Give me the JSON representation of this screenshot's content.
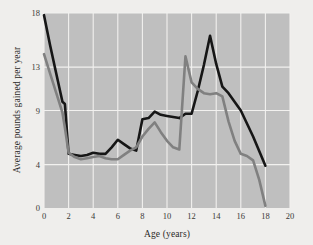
{
  "chart_data": {
    "type": "line",
    "title": "",
    "xlabel": "Age (years)",
    "ylabel": "Average pounds gained per year",
    "xlim": [
      0,
      20
    ],
    "ylim": [
      0,
      18
    ],
    "grid": true,
    "legend": "none",
    "plot_background": "#bfbfbf",
    "page_background": "#efeeec",
    "xticks": [
      {
        "value": 0,
        "label": "0"
      },
      {
        "value": 2,
        "label": "2"
      },
      {
        "value": 4,
        "label": "4"
      },
      {
        "value": 6,
        "label": "6"
      },
      {
        "value": 8,
        "label": "8"
      },
      {
        "value": 10,
        "label": "10"
      },
      {
        "value": 12,
        "label": "12"
      },
      {
        "value": 14,
        "label": "14"
      },
      {
        "value": 16,
        "label": "16"
      },
      {
        "value": 18,
        "label": "18"
      },
      {
        "value": 20,
        "label": "20"
      }
    ],
    "yticks": [
      {
        "value": 0,
        "label": "0"
      },
      {
        "value": 4,
        "label": "4"
      },
      {
        "value": 9,
        "label": "9"
      },
      {
        "value": 13,
        "label": "13"
      },
      {
        "value": 18,
        "label": "18"
      }
    ],
    "series": [
      {
        "name": "dark-series",
        "color": "#161616",
        "width": 2.6,
        "points": [
          [
            0.0,
            17.8
          ],
          [
            0.5,
            15.0
          ],
          [
            1.0,
            12.4
          ],
          [
            1.5,
            9.8
          ],
          [
            1.7,
            9.6
          ],
          [
            2.0,
            5.0
          ],
          [
            2.5,
            4.9
          ],
          [
            3.0,
            4.8
          ],
          [
            3.5,
            4.9
          ],
          [
            4.0,
            5.1
          ],
          [
            4.5,
            5.0
          ],
          [
            5.0,
            5.0
          ],
          [
            5.5,
            5.6
          ],
          [
            6.0,
            6.3
          ],
          [
            6.5,
            5.9
          ],
          [
            7.0,
            5.5
          ],
          [
            7.5,
            5.3
          ],
          [
            8.0,
            8.2
          ],
          [
            8.5,
            8.3
          ],
          [
            9.0,
            8.9
          ],
          [
            9.5,
            8.6
          ],
          [
            10.0,
            8.5
          ],
          [
            10.5,
            8.4
          ],
          [
            11.0,
            8.3
          ],
          [
            11.5,
            8.7
          ],
          [
            12.0,
            8.7
          ],
          [
            12.5,
            10.8
          ],
          [
            13.0,
            13.2
          ],
          [
            13.5,
            15.9
          ],
          [
            14.0,
            13.3
          ],
          [
            14.5,
            11.2
          ],
          [
            15.0,
            10.6
          ],
          [
            16.0,
            9.0
          ],
          [
            17.0,
            6.6
          ],
          [
            18.0,
            3.9
          ]
        ]
      },
      {
        "name": "gray-series",
        "color": "#808080",
        "width": 2.6,
        "points": [
          [
            0.0,
            14.2
          ],
          [
            0.5,
            12.4
          ],
          [
            1.0,
            10.6
          ],
          [
            1.5,
            8.8
          ],
          [
            1.7,
            7.4
          ],
          [
            2.0,
            5.1
          ],
          [
            2.5,
            4.7
          ],
          [
            3.0,
            4.5
          ],
          [
            3.5,
            4.6
          ],
          [
            4.0,
            4.7
          ],
          [
            4.5,
            4.8
          ],
          [
            5.0,
            4.6
          ],
          [
            5.5,
            4.5
          ],
          [
            6.0,
            4.5
          ],
          [
            6.5,
            4.9
          ],
          [
            7.0,
            5.3
          ],
          [
            7.5,
            5.6
          ],
          [
            8.0,
            6.6
          ],
          [
            8.5,
            7.3
          ],
          [
            9.0,
            7.9
          ],
          [
            9.5,
            7.0
          ],
          [
            10.0,
            6.2
          ],
          [
            10.5,
            5.6
          ],
          [
            11.0,
            5.4
          ],
          [
            11.5,
            14.0
          ],
          [
            12.0,
            11.6
          ],
          [
            12.5,
            11.0
          ],
          [
            13.0,
            10.6
          ],
          [
            13.5,
            10.5
          ],
          [
            14.0,
            10.6
          ],
          [
            14.5,
            10.3
          ],
          [
            15.0,
            8.0
          ],
          [
            15.5,
            6.2
          ],
          [
            16.0,
            5.0
          ],
          [
            16.5,
            4.8
          ],
          [
            17.0,
            4.4
          ],
          [
            17.5,
            2.6
          ],
          [
            18.0,
            0.2
          ]
        ]
      }
    ]
  }
}
